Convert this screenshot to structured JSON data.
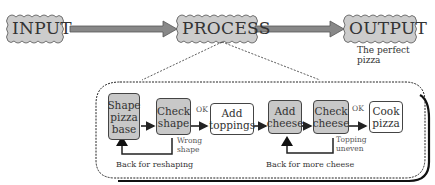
{
  "top_row": {
    "input": "INPUT",
    "process": "PROCESS",
    "output": "OUTPUT",
    "output_caption": "The perfect pizza"
  },
  "steps": [
    {
      "label": "Shape pizza base",
      "style": "grey"
    },
    {
      "label": "Check shape",
      "style": "grey"
    },
    {
      "label": "Add toppings",
      "style": "white"
    },
    {
      "label": "Add cheese",
      "style": "grey"
    },
    {
      "label": "Check cheese",
      "style": "grey"
    },
    {
      "label": "Cook pizza",
      "style": "white"
    }
  ],
  "labels": {
    "ok1": "OK",
    "ok2": "OK",
    "wrong_shape": "Wrong shape",
    "topping_uneven": "Topping uneven",
    "back_reshaping": "Back for reshaping",
    "back_cheese": "Back for more cheese"
  },
  "colors": {
    "shape_fill": "#c8c8c8",
    "arrow_fill": "#888888",
    "line": "#222222"
  }
}
